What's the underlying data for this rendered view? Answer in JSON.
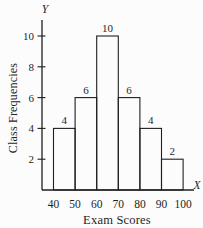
{
  "figure": {
    "background": "#fcfcfc",
    "ink_color": "#1f1f1f"
  },
  "chart_data": {
    "type": "bar",
    "subtype": "histogram",
    "xlabel": "Exam Scores",
    "ylabel": "Class Frequencies",
    "x_axis_letter": "X",
    "y_axis_letter": "Y",
    "bin_edges": [
      40,
      50,
      60,
      70,
      80,
      90,
      100
    ],
    "categories": [
      "40-50",
      "50-60",
      "60-70",
      "70-80",
      "80-90",
      "90-100"
    ],
    "values": [
      4,
      6,
      10,
      6,
      4,
      2
    ],
    "bar_labels": [
      "4",
      "6",
      "10",
      "6",
      "4",
      "2"
    ],
    "y_ticks": [
      2,
      4,
      6,
      8,
      10
    ],
    "x_ticks": [
      40,
      50,
      60,
      70,
      80,
      90,
      100
    ],
    "xlim": [
      40,
      100
    ],
    "ylim": [
      0,
      11
    ],
    "grid": false,
    "legend": false
  }
}
